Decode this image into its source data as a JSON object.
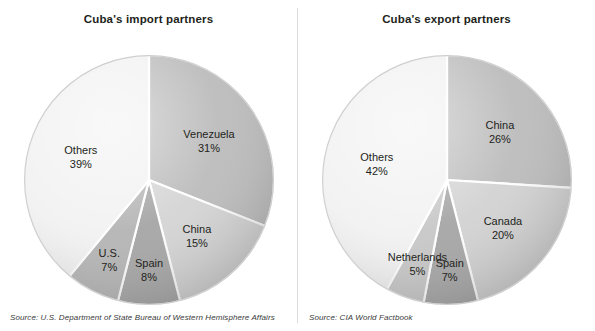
{
  "charts": [
    {
      "title": "Cuba's import partners",
      "source": "Source: U.S. Department of State Bureau of Western Hemisphere Affairs",
      "slices": [
        {
          "label": "Venezuela",
          "pct": "31%",
          "value": 31,
          "color": "#b8b8b8"
        },
        {
          "label": "China",
          "pct": "15%",
          "value": 15,
          "color": "#d2d2d2"
        },
        {
          "label": "Spain",
          "pct": "8%",
          "value": 8,
          "color": "#a0a0a0"
        },
        {
          "label": "U.S.",
          "pct": "7%",
          "value": 7,
          "color": "#b0b0b0"
        },
        {
          "label": "Others",
          "pct": "39%",
          "value": 39,
          "color": "#f1f1f1"
        }
      ]
    },
    {
      "title": "Cuba's export partners",
      "source": "Source: CIA World Factbook",
      "slices": [
        {
          "label": "China",
          "pct": "26%",
          "value": 26,
          "color": "#b8b8b8"
        },
        {
          "label": "Canada",
          "pct": "20%",
          "value": 20,
          "color": "#d0d0d0"
        },
        {
          "label": "Spain",
          "pct": "7%",
          "value": 7,
          "color": "#a0a0a0"
        },
        {
          "label": "Netherlands",
          "pct": "5%",
          "value": 5,
          "color": "#c4c4c4"
        },
        {
          "label": "Others",
          "pct": "42%",
          "value": 42,
          "color": "#f1f1f1"
        }
      ]
    }
  ],
  "chart_data": [
    {
      "type": "pie",
      "title": "Cuba's import partners",
      "categories": [
        "Venezuela",
        "China",
        "Spain",
        "U.S.",
        "Others"
      ],
      "values": [
        31,
        15,
        8,
        7,
        39
      ],
      "unit": "percent",
      "start_angle_deg": 0,
      "direction": "clockwise",
      "labels_inside": true,
      "legend": "none",
      "grid": false,
      "source": "Source: U.S. Department of State Bureau of Western Hemisphere Affairs",
      "colors": [
        "#b8b8b8",
        "#d2d2d2",
        "#a0a0a0",
        "#b0b0b0",
        "#f1f1f1"
      ]
    },
    {
      "type": "pie",
      "title": "Cuba's export partners",
      "categories": [
        "China",
        "Canada",
        "Spain",
        "Netherlands",
        "Others"
      ],
      "values": [
        26,
        20,
        7,
        5,
        42
      ],
      "unit": "percent",
      "start_angle_deg": 0,
      "direction": "clockwise",
      "labels_inside": true,
      "legend": "none",
      "grid": false,
      "source": "Source: CIA World Factbook",
      "colors": [
        "#b8b8b8",
        "#d0d0d0",
        "#a0a0a0",
        "#c4c4c4",
        "#f1f1f1"
      ]
    }
  ]
}
